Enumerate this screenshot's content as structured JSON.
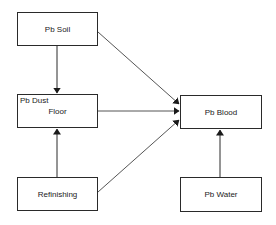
{
  "diagram": {
    "nodes": [
      {
        "id": "pb-soil",
        "label": "Pb Soil",
        "x": 17,
        "y": 12,
        "w": 81,
        "h": 34
      },
      {
        "id": "floor",
        "label": "Floor",
        "sublabel": "Pb Dust",
        "x": 17,
        "y": 94,
        "w": 81,
        "h": 34
      },
      {
        "id": "refinishing",
        "label": "Refinishing",
        "x": 17,
        "y": 177,
        "w": 81,
        "h": 34
      },
      {
        "id": "pb-blood",
        "label": "Pb Blood",
        "x": 180,
        "y": 95,
        "w": 82,
        "h": 34
      },
      {
        "id": "pb-water",
        "label": "Pb Water",
        "x": 180,
        "y": 177,
        "w": 82,
        "h": 35
      }
    ],
    "edges": [
      {
        "from": "pb-soil",
        "to": "floor"
      },
      {
        "from": "pb-soil",
        "to": "pb-blood"
      },
      {
        "from": "floor",
        "to": "pb-blood"
      },
      {
        "from": "refinishing",
        "to": "floor"
      },
      {
        "from": "refinishing",
        "to": "pb-blood"
      },
      {
        "from": "pb-water",
        "to": "pb-blood"
      }
    ],
    "line_color": "#2a2a2a"
  }
}
